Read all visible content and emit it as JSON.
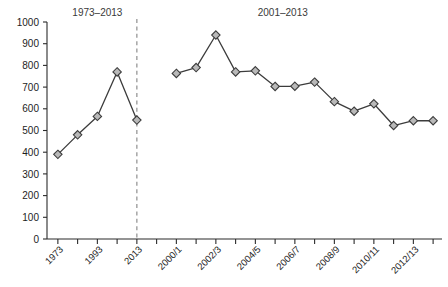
{
  "chart_data": {
    "type": "line",
    "title": "",
    "xlabel": "",
    "ylabel": "",
    "ylim": [
      0,
      1000
    ],
    "ytick_step": 100,
    "grid": false,
    "legend": false,
    "panels": [
      {
        "name": "panel-left",
        "title": "1973–2013",
        "categories": [
          "1973",
          "1983",
          "1993",
          "2003",
          "2013"
        ],
        "tick_labels": [
          "1973",
          "",
          "1993",
          "",
          "2013"
        ],
        "values": [
          390,
          480,
          565,
          770,
          548
        ]
      },
      {
        "name": "panel-right",
        "title": "2001–2013",
        "categories": [
          "2000/1",
          "2001/2",
          "2002/3",
          "2003/4",
          "2004/5",
          "2005/6",
          "2006/7",
          "2007/8",
          "2008/9",
          "2009/10",
          "2010/11",
          "2011/12",
          "2012/13",
          "2013/14"
        ],
        "tick_labels": [
          "2000/1",
          "",
          "2002/3",
          "",
          "2004/5",
          "",
          "2006/7",
          "",
          "2008/9",
          "",
          "2010/11",
          "",
          "2012/13",
          ""
        ],
        "values": [
          763,
          790,
          940,
          770,
          775,
          703,
          704,
          723,
          633,
          589,
          623,
          523,
          545,
          545
        ]
      }
    ],
    "ytick_labels": [
      "0",
      "100",
      "200",
      "300",
      "400",
      "500",
      "600",
      "700",
      "800",
      "900",
      "1000"
    ],
    "divider": {
      "after_index": 4,
      "style": "dashed"
    },
    "marker": {
      "shape": "diamond",
      "fill": "#b9b9b9",
      "stroke": "#3c3c3c"
    },
    "line_color": "#3c3c3c",
    "axis_color": "#2b2b2b"
  }
}
